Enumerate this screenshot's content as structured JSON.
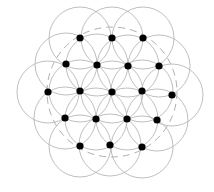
{
  "diagram": {
    "type": "hexagonal-lattice-circles",
    "width": 214,
    "height": 192,
    "colors": {
      "background": "#ffffff",
      "circle_stroke": "#b8b8b8",
      "dashed_stroke": "#b0b0b0",
      "node_fill": "#000000"
    },
    "circle_radius": 31,
    "node_radius": 3.6,
    "dashed_circle": {
      "cx": 112,
      "cy": 92,
      "r": 65
    },
    "nodes": [
      {
        "x": 80,
        "y": 38
      },
      {
        "x": 112,
        "y": 38
      },
      {
        "x": 143,
        "y": 38
      },
      {
        "x": 66,
        "y": 64
      },
      {
        "x": 97,
        "y": 65
      },
      {
        "x": 128,
        "y": 66
      },
      {
        "x": 159,
        "y": 66
      },
      {
        "x": 48,
        "y": 92
      },
      {
        "x": 80,
        "y": 91
      },
      {
        "x": 112,
        "y": 92
      },
      {
        "x": 142,
        "y": 91
      },
      {
        "x": 172,
        "y": 95
      },
      {
        "x": 65,
        "y": 118
      },
      {
        "x": 96,
        "y": 119
      },
      {
        "x": 127,
        "y": 119
      },
      {
        "x": 157,
        "y": 120
      },
      {
        "x": 80,
        "y": 146
      },
      {
        "x": 110,
        "y": 145
      },
      {
        "x": 142,
        "y": 147
      }
    ]
  }
}
